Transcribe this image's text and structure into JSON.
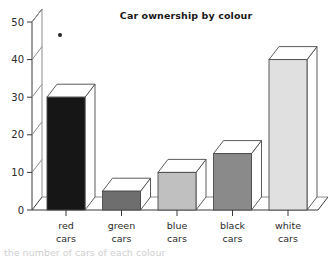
{
  "chart_data": {
    "type": "bar",
    "title": "Car ownership by colour",
    "xlabel": "",
    "ylabel": "",
    "categories": [
      "red cars",
      "green cars",
      "blue cars",
      "black cars",
      "white cars"
    ],
    "category_lines": [
      [
        "red",
        "cars"
      ],
      [
        "green",
        "cars"
      ],
      [
        "blue",
        "cars"
      ],
      [
        "black",
        "cars"
      ],
      [
        "white",
        "cars"
      ]
    ],
    "values": [
      30,
      5,
      10,
      15,
      40
    ],
    "ylim": [
      0,
      50
    ],
    "yticks": [
      0,
      10,
      20,
      30,
      40,
      50
    ],
    "ytick_labels": [
      "0",
      "10",
      "20",
      "30",
      "40",
      "50"
    ],
    "grid": false,
    "legend": false,
    "style": "3d-bar",
    "bar_colors": [
      "#161616",
      "#6e6e6e",
      "#c0c0c0",
      "#8a8a8a",
      "#e0e0e0"
    ],
    "bar_top_color": "#ffffff",
    "bar_side_color": "#ffffff",
    "axis_color": "#3a3a3a",
    "wall_color": "#8d8d8d",
    "title_color": "#1a1a1a",
    "background": "#ffffff"
  },
  "artifacts": {
    "ink_speck_label": "ink-speck",
    "bottom_cropped_text": "the number of cars of each colour"
  }
}
